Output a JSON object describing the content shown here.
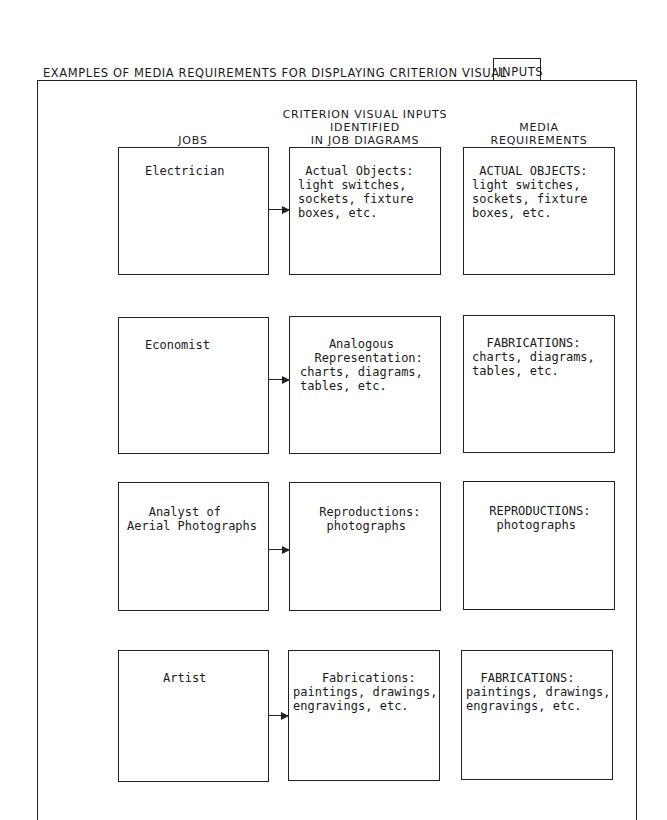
{
  "title": {
    "prefix": "EXAMPLES OF MEDIA REQUIREMENTS FOR DISPLAYING CRITERION VISUAL",
    "boxed": "INPUTS"
  },
  "headers": {
    "jobs": "JOBS",
    "criterion_line1": "CRITERION VISUAL INPUTS",
    "criterion_line2": "IDENTIFIED",
    "criterion_line3": "IN JOB DIAGRAMS",
    "media_line1": "MEDIA",
    "media_line2": "REQUIREMENTS"
  },
  "rows": [
    {
      "job": "Electrician",
      "criterion": " Actual Objects:\nlight switches,\nsockets, fixture\nboxes, etc.",
      "media": " ACTUAL OBJECTS:\nlight switches,\nsockets, fixture\nboxes, etc."
    },
    {
      "job": "Economist",
      "criterion": "    Analogous\n  Representation:\ncharts, diagrams,\ntables, etc.",
      "media": "  FABRICATIONS:\ncharts, diagrams,\ntables, etc."
    },
    {
      "job": "   Analyst of\nAerial Photographs",
      "criterion": " Reproductions:\n  photographs",
      "media": " REPRODUCTIONS:\n  photographs"
    },
    {
      "job": "Artist",
      "criterion": "    Fabrications:\npaintings, drawings,\nengravings, etc.",
      "media": "  FABRICATIONS:\npaintings, drawings,\nengravings, etc."
    }
  ]
}
